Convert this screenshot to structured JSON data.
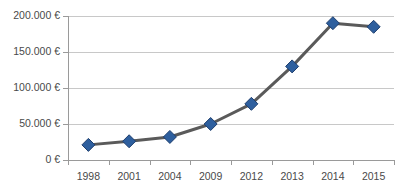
{
  "title_remnant": "",
  "chart_data": {
    "type": "line",
    "title": "",
    "xlabel": "",
    "ylabel": "",
    "categories": [
      "1998",
      "2001",
      "2004",
      "2009",
      "2012",
      "2013",
      "2014",
      "2015"
    ],
    "values": [
      21000,
      26000,
      32000,
      50000,
      78000,
      130000,
      190000,
      185000
    ],
    "series": [
      {
        "name": "",
        "values": [
          21000,
          26000,
          32000,
          50000,
          78000,
          130000,
          190000,
          185000
        ]
      }
    ],
    "ylim": [
      0,
      200000
    ],
    "ytick_values": [
      0,
      50000,
      100000,
      150000,
      200000
    ],
    "ytick_labels": [
      "0 €",
      "50.000 €",
      "100.000 €",
      "150.000 €",
      "200.000 €"
    ],
    "grid": true,
    "legend": "none",
    "marker": "diamond",
    "colors": {
      "marker_fill": "#2e5f9e",
      "marker_stroke": "#1f3f6e",
      "line": "#5a5a5a",
      "gridline": "#c8c8c8",
      "axis": "#9a9a9a",
      "tick_label": "#4a4a4a",
      "background": "#ffffff"
    }
  }
}
